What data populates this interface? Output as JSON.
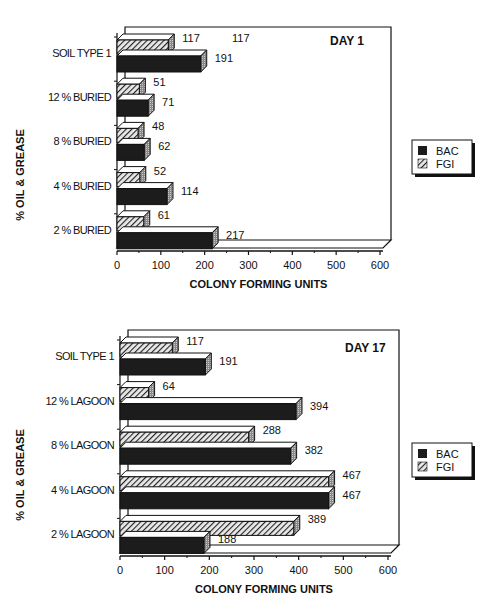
{
  "chart_data": [
    {
      "type": "bar",
      "orientation": "horizontal",
      "title": "DAY 1",
      "xlabel": "COLONY FORMING UNITS",
      "ylabel": "% OIL & GREASE",
      "xlim": [
        0,
        600
      ],
      "xticks": [
        "0",
        "100",
        "200",
        "300",
        "400",
        "500",
        "600"
      ],
      "categories": [
        "SOIL TYPE 1",
        "12 % BURIED",
        "8 % BURIED",
        "4 % BURIED",
        "2 % BURIED"
      ],
      "series": [
        {
          "name": "BAC",
          "values": [
            191,
            71,
            62,
            114,
            217
          ]
        },
        {
          "name": "FGI",
          "values": [
            117,
            51,
            48,
            52,
            61
          ]
        }
      ],
      "annotations": [
        "117"
      ],
      "legend": {
        "position": "right",
        "entries": [
          "BAC",
          "FGI"
        ]
      },
      "grid": false
    },
    {
      "type": "bar",
      "orientation": "horizontal",
      "title": "DAY 17",
      "xlabel": "COLONY FORMING UNITS",
      "ylabel": "% OIL & GREASE",
      "xlim": [
        0,
        600
      ],
      "xticks": [
        "0",
        "100",
        "200",
        "300",
        "400",
        "500",
        "600"
      ],
      "categories": [
        "SOIL TYPE 1",
        "12 % LAGOON",
        "8 % LAGOON",
        "4 % LAGOON",
        "2 % LAGOON"
      ],
      "series": [
        {
          "name": "BAC",
          "values": [
            191,
            394,
            382,
            467,
            188
          ]
        },
        {
          "name": "FGI",
          "values": [
            117,
            64,
            288,
            467,
            389
          ]
        }
      ],
      "legend": {
        "position": "right",
        "entries": [
          "BAC",
          "FGI"
        ]
      },
      "grid": false
    }
  ],
  "charts": [
    {
      "title": "DAY 1",
      "xlabel": "COLONY FORMING UNITS",
      "ylabel": "% OIL & GREASE",
      "extra_label": "117",
      "categories": [
        "SOIL TYPE 1",
        "12 % BURIED",
        "8 % BURIED",
        "4 % BURIED",
        "2 % BURIED"
      ],
      "bac": [
        191,
        71,
        62,
        114,
        217
      ],
      "fgi": [
        117,
        51,
        48,
        52,
        61
      ],
      "bac_labels": [
        "191",
        "71",
        "62",
        "114",
        "217"
      ],
      "fgi_labels": [
        "117",
        "51",
        "48",
        "52",
        "61"
      ],
      "ticks": [
        "0",
        "100",
        "200",
        "300",
        "400",
        "500",
        "600"
      ]
    },
    {
      "title": "DAY 17",
      "xlabel": "COLONY FORMING UNITS",
      "ylabel": "% OIL & GREASE",
      "categories": [
        "SOIL TYPE 1",
        "12 % LAGOON",
        "8 % LAGOON",
        "4 % LAGOON",
        "2 % LAGOON"
      ],
      "bac": [
        191,
        394,
        382,
        467,
        188
      ],
      "fgi": [
        117,
        64,
        288,
        467,
        389
      ],
      "bac_labels": [
        "191",
        "394",
        "382",
        "467",
        "188"
      ],
      "fgi_labels": [
        "117",
        "64",
        "288",
        "467",
        "389"
      ],
      "ticks": [
        "0",
        "100",
        "200",
        "300",
        "400",
        "500",
        "600"
      ]
    }
  ],
  "legend": {
    "bac": "BAC",
    "fgi": "FGI"
  },
  "colors": {
    "bac": "#1a1a1a",
    "fgi_hatch": "#333333",
    "side": "#999999",
    "top": "#ffffff",
    "frame": "#111111"
  }
}
